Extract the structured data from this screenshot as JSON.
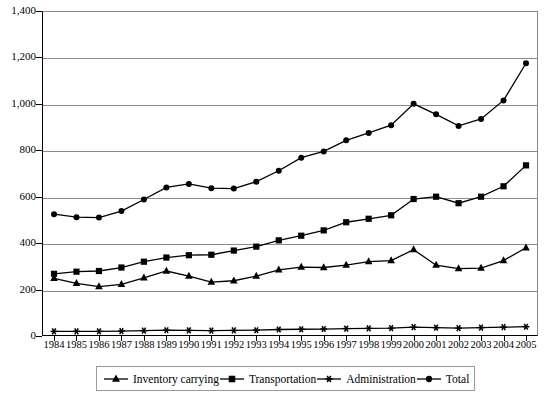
{
  "chart_data": {
    "type": "line",
    "title": "",
    "subtitle": "",
    "xlabel": "",
    "ylabel": "",
    "xlim": [
      1984,
      2005
    ],
    "ylim": [
      0,
      1400
    ],
    "grid": true,
    "legend_position": "bottom",
    "x": [
      1984,
      1985,
      1986,
      1987,
      1988,
      1989,
      1990,
      1991,
      1992,
      1993,
      1994,
      1995,
      1996,
      1997,
      1998,
      1999,
      2000,
      2001,
      2002,
      2003,
      2004,
      2005
    ],
    "categories": [
      "1984",
      "1985",
      "1986",
      "1987",
      "1988",
      "1989",
      "1990",
      "1991",
      "1992",
      "1993",
      "1994",
      "1995",
      "1996",
      "1997",
      "1998",
      "1999",
      "2000",
      "2001",
      "2002",
      "2003",
      "2004",
      "2005"
    ],
    "yticks": [
      0,
      200,
      400,
      600,
      800,
      1000,
      1200,
      1400
    ],
    "ytick_labels": [
      "0",
      "200",
      "400",
      "600",
      "800",
      "1,000",
      "1,200",
      "1,400"
    ],
    "series": [
      {
        "name": "Inventory carrying",
        "marker": "triangle",
        "color": "#000000",
        "values": [
          248,
          227,
          213,
          222,
          250,
          280,
          258,
          232,
          238,
          258,
          285,
          297,
          295,
          305,
          320,
          325,
          372,
          305,
          290,
          292,
          325,
          380
        ]
      },
      {
        "name": "Transportation",
        "marker": "square",
        "color": "#000000",
        "values": [
          268,
          277,
          280,
          295,
          320,
          338,
          348,
          350,
          368,
          385,
          412,
          432,
          455,
          490,
          505,
          520,
          590,
          600,
          572,
          600,
          645,
          735
        ]
      },
      {
        "name": "Administration",
        "marker": "asterisk",
        "color": "#000000",
        "values": [
          20,
          20,
          20,
          21,
          23,
          25,
          24,
          23,
          24,
          25,
          28,
          29,
          30,
          32,
          33,
          34,
          38,
          36,
          34,
          36,
          38,
          40
        ]
      },
      {
        "name": "Total",
        "marker": "circle",
        "color": "#000000",
        "values": [
          525,
          512,
          510,
          538,
          588,
          640,
          655,
          637,
          635,
          665,
          712,
          768,
          795,
          843,
          875,
          908,
          1000,
          955,
          905,
          935,
          1015,
          1175
        ]
      }
    ]
  },
  "legend": {
    "items": [
      {
        "label": "Inventory carrying",
        "marker": "triangle"
      },
      {
        "label": "Transportation",
        "marker": "square"
      },
      {
        "label": "Administration",
        "marker": "asterisk"
      },
      {
        "label": "Total",
        "marker": "circle"
      }
    ]
  },
  "colors": {
    "axis": "#000000",
    "grid": "#8c8c8c",
    "series": "#000000",
    "background": "#ffffff"
  }
}
